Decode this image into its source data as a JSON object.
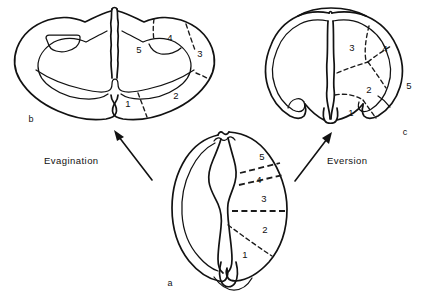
{
  "figure": {
    "background_color": "#ffffff",
    "ink_color": "#121212"
  },
  "panels": [
    {
      "id": "a",
      "letter": "a",
      "name": "undifferentiated-disc",
      "letter_x": 170,
      "letter_y": 284,
      "regions": [
        {
          "label": "5",
          "x": 262,
          "y": 157
        },
        {
          "label": "4",
          "x": 259,
          "y": 180
        },
        {
          "label": "3",
          "x": 264,
          "y": 199
        },
        {
          "label": "2",
          "x": 265,
          "y": 230
        },
        {
          "label": "1",
          "x": 245,
          "y": 255
        }
      ]
    },
    {
      "id": "b",
      "letter": "b",
      "name": "evaginated-disc",
      "letter_x": 31,
      "letter_y": 120,
      "regions": [
        {
          "label": "5",
          "x": 139,
          "y": 50
        },
        {
          "label": "4",
          "x": 170,
          "y": 38
        },
        {
          "label": "3",
          "x": 200,
          "y": 54
        },
        {
          "label": "2",
          "x": 176,
          "y": 96
        },
        {
          "label": "1",
          "x": 128,
          "y": 104
        }
      ]
    },
    {
      "id": "c",
      "letter": "c",
      "name": "everted-disc",
      "letter_x": 405,
      "letter_y": 133,
      "regions": [
        {
          "label": "3",
          "x": 352,
          "y": 48
        },
        {
          "label": "4",
          "x": 385,
          "y": 49
        },
        {
          "label": "5",
          "x": 409,
          "y": 86
        },
        {
          "label": "2",
          "x": 369,
          "y": 90
        },
        {
          "label": "1",
          "x": 351,
          "y": 113
        }
      ]
    }
  ],
  "process_labels": [
    {
      "id": "evagination",
      "text": "Evagination",
      "x": 44,
      "y": 161
    },
    {
      "id": "eversion",
      "text": "Eversion",
      "x": 327,
      "y": 161
    }
  ],
  "arrows": [
    {
      "id": "evagination-arrow",
      "name": "evagination-arrow",
      "from_panel": "a",
      "to_panel": "b",
      "direction": "up-left"
    },
    {
      "id": "eversion-arrow",
      "name": "eversion-arrow",
      "from_panel": "a",
      "to_panel": "c",
      "direction": "up-right"
    }
  ]
}
